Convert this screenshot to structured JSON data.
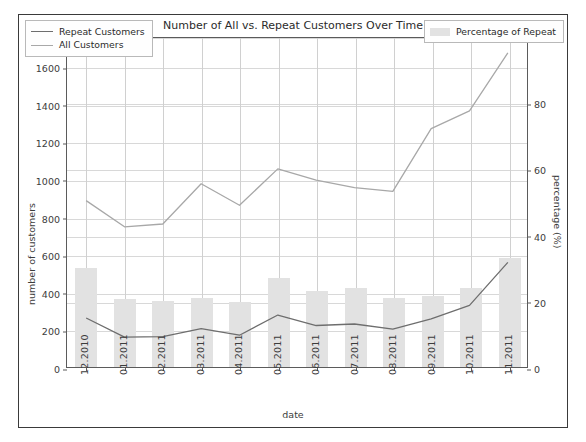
{
  "chart_data": {
    "type": "line",
    "title": "Number of All vs. Repeat Customers Over Time",
    "xlabel": "date",
    "ylabel": "number of customers",
    "ylabel_right": "percentage (%)",
    "grid": true,
    "categories": [
      "12.2010",
      "01.2011",
      "02.2011",
      "03.2011",
      "04.2011",
      "05.2011",
      "06.2011",
      "07.2011",
      "08.2011",
      "09.2011",
      "10.2011",
      "11.2011"
    ],
    "ylim": [
      0,
      1760
    ],
    "yticks": [
      0,
      200,
      400,
      600,
      800,
      1000,
      1200,
      1400,
      1600
    ],
    "ylim_right": [
      0,
      100
    ],
    "yticks_right": [
      0,
      20,
      40,
      60,
      80,
      100
    ],
    "series": [
      {
        "name": "All Customers",
        "axis": "left",
        "color": "#a8a8a8",
        "values": [
          890,
          750,
          765,
          980,
          865,
          1060,
          1000,
          960,
          940,
          1275,
          1370,
          1680
        ]
      },
      {
        "name": "Repeat Customers",
        "axis": "left",
        "color": "#6e6e6e",
        "values": [
          262,
          160,
          163,
          205,
          170,
          278,
          222,
          230,
          203,
          258,
          330,
          560
        ]
      },
      {
        "name": "Percentage of Repeat",
        "axis": "right",
        "type": "bar",
        "color": "#e2e2e2",
        "values": [
          30.0,
          20.5,
          20.0,
          21.0,
          19.5,
          27.0,
          23.0,
          24.0,
          21.0,
          21.5,
          24.0,
          33.0
        ]
      }
    ],
    "legend_lines": [
      "Repeat Customers",
      "All Customers"
    ],
    "legend_bars": [
      "Percentage of Repeat"
    ]
  },
  "colors": {
    "all_customers": "#a8a8a8",
    "repeat_customers": "#6e6e6e",
    "bars": "#e2e2e2",
    "grid": "#d8d8d8",
    "axis": "#5b5b5b",
    "frame": "#3a3a3a"
  }
}
